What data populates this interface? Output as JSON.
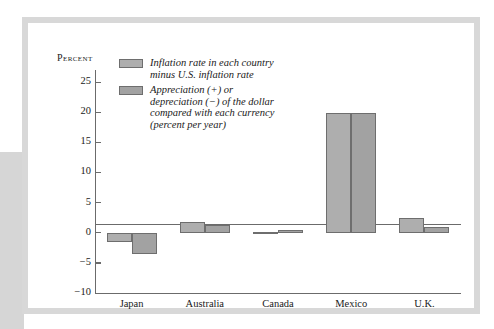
{
  "chart_data": {
    "type": "bar",
    "title": "",
    "xlabel": "",
    "ylabel": "Percent",
    "ylim": [
      -10,
      27
    ],
    "yticks": [
      -10,
      -5,
      0,
      5,
      10,
      15,
      20,
      25
    ],
    "ytick_labels": [
      "−10",
      "−5",
      "0",
      "5",
      "10",
      "15",
      "20",
      "25"
    ],
    "grid": false,
    "legend_position": "inside-top-left",
    "categories": [
      "Japan",
      "Australia",
      "Canada",
      "Mexico",
      "U.K."
    ],
    "series": [
      {
        "name": "Inflation rate in each country minus U.S. inflation rate",
        "color": "#aeaeae",
        "values": [
          -1.5,
          1.7,
          0.2,
          19.8,
          2.4
        ]
      },
      {
        "name": "Appreciation (+) or depreciation (−) of the dollar compared with each currency (percent per year)",
        "color": "#a2a2a2",
        "values": [
          -3.5,
          1.2,
          0.5,
          19.8,
          1.0
        ]
      }
    ],
    "legend": [
      {
        "swatch": "#aeaeae",
        "lines": [
          "Inflation rate in each country",
          "minus U.S. inflation rate"
        ]
      },
      {
        "swatch": "#a2a2a2",
        "lines": [
          "Appreciation (+) or",
          "depreciation (−) of the dollar",
          "compared with each currency",
          "(percent per year)"
        ]
      }
    ]
  },
  "axis": {
    "y_title": "Percent"
  },
  "colors": {
    "series_1": "#aeaeae",
    "series_2": "#a2a2a2",
    "axis": "#6b6b6b",
    "bar_border": "#6e6e6e",
    "frame": "#d8d8d8",
    "side_block": "#d6d6d6",
    "text": "#1a1a1a"
  }
}
